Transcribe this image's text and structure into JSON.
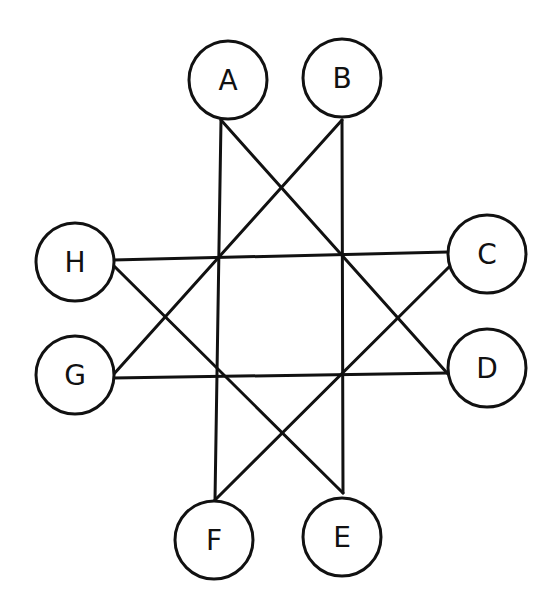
{
  "diagram": {
    "type": "graph",
    "nodes": [
      {
        "id": "A",
        "label": "A",
        "cx": 228,
        "cy": 80,
        "r": 39
      },
      {
        "id": "B",
        "label": "B",
        "cx": 342,
        "cy": 78,
        "r": 39
      },
      {
        "id": "C",
        "label": "C",
        "cx": 487,
        "cy": 254,
        "r": 39
      },
      {
        "id": "D",
        "label": "D",
        "cx": 487,
        "cy": 368,
        "r": 39
      },
      {
        "id": "E",
        "label": "E",
        "cx": 342,
        "cy": 537,
        "r": 39
      },
      {
        "id": "F",
        "label": "F",
        "cx": 214,
        "cy": 540,
        "r": 39
      },
      {
        "id": "G",
        "label": "G",
        "cx": 75,
        "cy": 375,
        "r": 39
      },
      {
        "id": "H",
        "label": "H",
        "cx": 75,
        "cy": 262,
        "r": 39
      }
    ],
    "edges": [
      {
        "from": "A",
        "to": "F",
        "x1": 221,
        "y1": 120,
        "x2": 215,
        "y2": 500
      },
      {
        "from": "A",
        "to": "D",
        "x1": 221,
        "y1": 120,
        "x2": 448,
        "y2": 374
      },
      {
        "from": "B",
        "to": "E",
        "x1": 342,
        "y1": 120,
        "x2": 343,
        "y2": 493
      },
      {
        "from": "B",
        "to": "G",
        "x1": 342,
        "y1": 120,
        "x2": 113,
        "y2": 375
      },
      {
        "from": "H",
        "to": "C",
        "x1": 113,
        "y1": 260,
        "x2": 448,
        "y2": 252
      },
      {
        "from": "H",
        "to": "E",
        "x1": 113,
        "y1": 265,
        "x2": 343,
        "y2": 493
      },
      {
        "from": "G",
        "to": "D",
        "x1": 113,
        "y1": 378,
        "x2": 448,
        "y2": 373
      },
      {
        "from": "C",
        "to": "F",
        "x1": 450,
        "y1": 266,
        "x2": 215,
        "y2": 500
      }
    ]
  }
}
